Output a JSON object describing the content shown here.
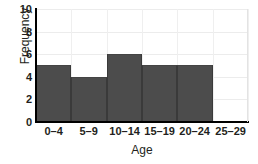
{
  "chart_data": {
    "type": "bar",
    "title": "",
    "xlabel": "Age",
    "ylabel": "Frequency",
    "categories": [
      "0–4",
      "5–9",
      "10–14",
      "15–19",
      "20–24",
      "25–29"
    ],
    "values": [
      5,
      4,
      6,
      5,
      5,
      0
    ],
    "ylim": [
      0,
      10
    ],
    "yticks": [
      0,
      2,
      4,
      6,
      8,
      10
    ],
    "ytick_labels": [
      "0",
      "2",
      "4",
      "6",
      "8",
      "10"
    ],
    "grid": true,
    "legend": "none",
    "bar_color": "#4c4c4c",
    "axis_color": "#000000",
    "grid_color": "#ececec",
    "text_color": "#231f20"
  }
}
